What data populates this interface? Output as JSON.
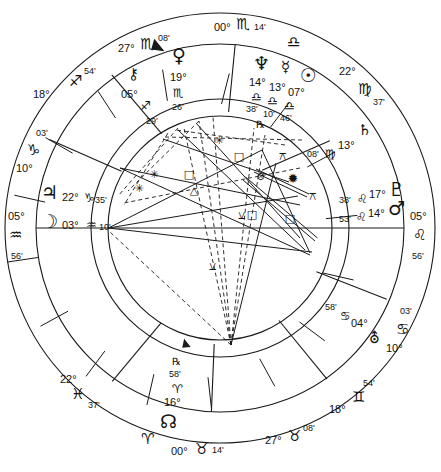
{
  "chart": {
    "type": "natal-wheel",
    "glyphs": {
      "aries": "♈",
      "taurus": "♉",
      "gemini": "♊",
      "cancer": "♋",
      "leo": "♌",
      "virgo": "♍",
      "libra": "♎",
      "scorpio": "♏",
      "sagittarius": "♐",
      "capricorn": "♑",
      "aquarius": "♒",
      "pisces": "♓",
      "sun": "☉",
      "moon": "☽",
      "mercury": "☿",
      "venus": "♀",
      "mars": "♂",
      "jupiter": "♃",
      "saturn": "♄",
      "uranus": "⛢",
      "neptune": "♆",
      "pluto": "♇",
      "chiron": "⚷",
      "north-node": "☊",
      "retrograde": "℞",
      "degree": "°",
      "minute": "'"
    },
    "angles": {
      "mc": {
        "label": "Midheaven",
        "deg": "00°",
        "sign": "scorpio",
        "min": "14'"
      },
      "ic": {
        "label": "Imum Coeli",
        "deg": "00°",
        "sign": "taurus",
        "min": "14'"
      },
      "asc": {
        "label": "Ascendant",
        "deg": "05°",
        "sign": "aquarius",
        "min": "56'"
      },
      "dsc": {
        "label": "Descendant",
        "deg": "05°",
        "sign": "leo",
        "min": "56'"
      }
    },
    "house_cusps": [
      {
        "id": "cusp-11",
        "deg": "27°",
        "sign": "scorpio",
        "min": "08'"
      },
      {
        "id": "cusp-12",
        "deg": "18°",
        "sign": "sagittarius",
        "min": "54'"
      },
      {
        "id": "cusp-1",
        "deg": "10°",
        "sign": "capricorn",
        "min": "03'"
      },
      {
        "id": "cusp-2",
        "deg": "22°",
        "sign": "pisces",
        "min": "37'"
      },
      {
        "id": "cusp-3",
        "deg": "27°",
        "sign": "taurus",
        "min": "08'"
      },
      {
        "id": "cusp-4",
        "deg": "18°",
        "sign": "gemini",
        "min": "54'"
      },
      {
        "id": "cusp-5",
        "deg": "10°",
        "sign": "cancer",
        "min": "03'"
      },
      {
        "id": "cusp-6",
        "deg": "22°",
        "sign": "virgo",
        "min": "37'"
      }
    ],
    "planets": [
      {
        "id": "venus",
        "name": "Venus",
        "glyph": "venus",
        "deg": "19°",
        "sign": "scorpio",
        "min": "26'",
        "retro": ""
      },
      {
        "id": "chiron",
        "name": "Chiron",
        "glyph": "chiron",
        "deg": "05°",
        "sign": "sagittarius",
        "min": "29'",
        "retro": ""
      },
      {
        "id": "neptune",
        "name": "Neptune",
        "glyph": "neptune",
        "deg": "14°",
        "sign": "libra",
        "min": "38'",
        "retro": "℞"
      },
      {
        "id": "mercury",
        "name": "Mercury",
        "glyph": "mercury",
        "deg": "13°",
        "sign": "libra",
        "min": "10'",
        "retro": ""
      },
      {
        "id": "sun",
        "name": "Sun",
        "glyph": "sun",
        "deg": "07°",
        "sign": "libra",
        "min": "46'",
        "retro": ""
      },
      {
        "id": "saturn",
        "name": "Saturn",
        "glyph": "saturn",
        "deg": "13°",
        "sign": "virgo",
        "min": "08'",
        "retro": ""
      },
      {
        "id": "pluto",
        "name": "Pluto",
        "glyph": "pluto",
        "deg": "17°",
        "sign": "leo",
        "min": "38'",
        "retro": ""
      },
      {
        "id": "mars",
        "name": "Mars",
        "glyph": "mars",
        "deg": "14°",
        "sign": "leo",
        "min": "53'",
        "retro": ""
      },
      {
        "id": "uranus",
        "name": "Uranus",
        "glyph": "uranus",
        "deg": "04°",
        "sign": "cancer",
        "min": "58'",
        "retro": ""
      },
      {
        "id": "northnode",
        "name": "North Node",
        "glyph": "north-node",
        "deg": "16°",
        "sign": "aries",
        "min": "58'",
        "retro": "℞"
      },
      {
        "id": "jupiter",
        "name": "Jupiter",
        "glyph": "jupiter",
        "deg": "22°",
        "sign": "capricorn",
        "min": "35'",
        "retro": ""
      },
      {
        "id": "moon",
        "name": "Moon",
        "glyph": "moon",
        "deg": "03°",
        "sign": "aquarius",
        "min": "10'",
        "retro": ""
      }
    ],
    "aspect_symbols": {
      "square": "□",
      "trine": "△",
      "sextile": "✳",
      "opposition": "⦻",
      "conjunction": "✹",
      "quincunx": "⚻",
      "semisextile": "⚺"
    },
    "colors": {
      "stroke": "#1a1a1a",
      "background": "#ffffff",
      "text": "#111111"
    }
  },
  "caption": {
    "text": ""
  }
}
